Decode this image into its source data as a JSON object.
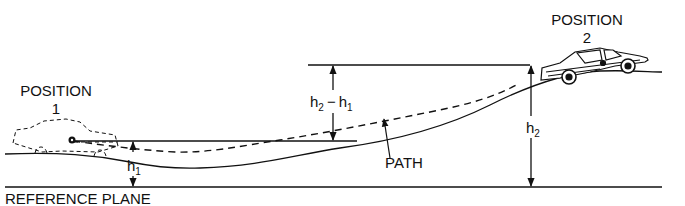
{
  "diagram": {
    "type": "physics-energy-diagram",
    "labels": {
      "position1_title": "POSITION",
      "position1_number": "1",
      "position2_title": "POSITION",
      "position2_number": "2",
      "path": "PATH",
      "reference_plane": "REFERENCE PLANE",
      "h1_base": "h",
      "h1_sub": "1",
      "h2_base": "h",
      "h2_sub": "2",
      "diff_h2_base": "h",
      "diff_h2_sub": "2",
      "diff_minus": "−",
      "diff_h1_base": "h",
      "diff_h1_sub": "1"
    },
    "elements": {
      "reference_plane_line": "solid horizontal baseline",
      "ground_profile": "solid curved road",
      "path_line": "dashed center-of-mass trajectory",
      "car_position1": "dashed outline car",
      "car_position2": "solid drawn car",
      "dimension_h1": "vertical double arrow from reference plane to position 1 height",
      "dimension_h2": "vertical double arrow from reference plane to position 2 height",
      "dimension_h2_minus_h1": "vertical double arrow between position 1 and position 2 heights"
    },
    "colors": {
      "ink": "#111111",
      "background": "#ffffff"
    }
  }
}
